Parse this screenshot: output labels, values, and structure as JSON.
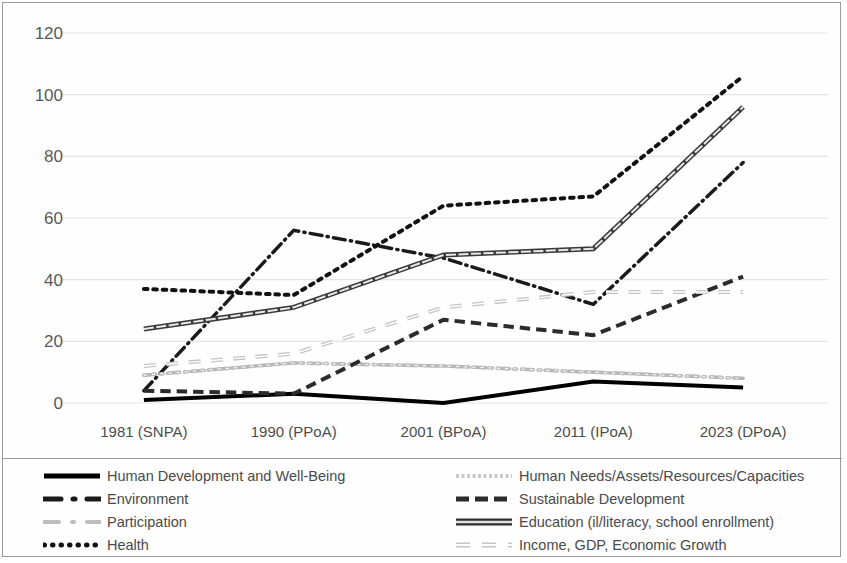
{
  "chart_data": {
    "type": "line",
    "title": "",
    "xlabel": "",
    "ylabel": "",
    "categories": [
      "1981 (SNPA)",
      "1990 (PPoA)",
      "2001 (BPoA)",
      "2011 (IPoA)",
      "2023 (DPoA)"
    ],
    "ylim": [
      0,
      120
    ],
    "yticks": [
      0,
      20,
      40,
      60,
      80,
      100,
      120
    ],
    "grid": true,
    "legend_position": "bottom",
    "series": [
      {
        "name": "Human Development and Well-Being",
        "values": [
          1,
          3,
          0,
          7,
          5
        ],
        "style": "solid",
        "color": "#000000",
        "width": 4
      },
      {
        "name": "Environment",
        "values": [
          4,
          56,
          47,
          32,
          78
        ],
        "style": "dashdot",
        "color": "#1a1a1a",
        "width": 3.5
      },
      {
        "name": "Participation",
        "values": [
          9,
          13,
          12,
          10,
          8
        ],
        "style": "dashdot",
        "color": "#b5b5b5",
        "width": 3.5
      },
      {
        "name": "Health",
        "values": [
          37,
          35,
          64,
          67,
          106
        ],
        "style": "dotted",
        "color": "#111111",
        "width": 4
      },
      {
        "name": "Human Needs/Assets/Resources/Capacities",
        "values": [
          9,
          13,
          12,
          10,
          8
        ],
        "style": "dotted-light",
        "color": "#bdbdbd",
        "width": 3.5
      },
      {
        "name": "Sustainable Development",
        "values": [
          4,
          3,
          27,
          22,
          41
        ],
        "style": "dashed",
        "color": "#2b2b2b",
        "width": 4
      },
      {
        "name": "Education (il/literacy, school enrollment)",
        "values": [
          24,
          31,
          48,
          50,
          96
        ],
        "style": "solid-outline",
        "color": "#3a3a3a",
        "width": 5
      },
      {
        "name": "Income, GDP, Economic Growth",
        "values": [
          12,
          16,
          31,
          36,
          36
        ],
        "style": "dashed-light",
        "color": "#c4c4c4",
        "width": 4
      }
    ]
  },
  "legend": {
    "left_column": [
      {
        "label": "Human Development and Well-Being",
        "marker": "solid-thick-dark"
      },
      {
        "label": "Environment",
        "marker": "dashdot-dark"
      },
      {
        "label": "Participation",
        "marker": "dashdot-light"
      },
      {
        "label": "Health",
        "marker": "dotted-dark"
      }
    ],
    "right_column": [
      {
        "label": "Human Needs/Assets/Resources/Capacities",
        "marker": "dotted-light"
      },
      {
        "label": "Sustainable Development",
        "marker": "dashed-dark"
      },
      {
        "label": "Education (il/literacy, school enrollment)",
        "marker": "solid-thick-outline"
      },
      {
        "label": "Income, GDP, Economic Growth",
        "marker": "dashed-light"
      }
    ]
  },
  "colors": {
    "border": "#9a9a9a",
    "grid": "#e4e4e4",
    "tick_text": "#595959",
    "background": "#ffffff"
  }
}
